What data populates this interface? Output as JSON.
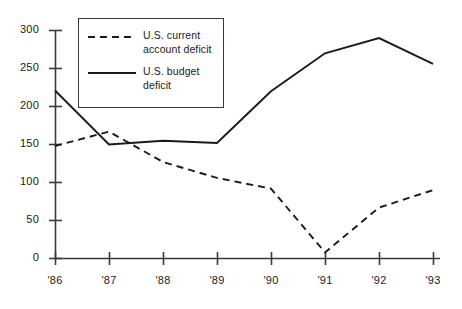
{
  "chart_data": {
    "type": "line",
    "title": "",
    "subtitle": "",
    "xlabel": "",
    "ylabel": "",
    "x": [
      "'86",
      "'87",
      "'88",
      "'89",
      "'90",
      "'91",
      "'92",
      "'93"
    ],
    "categories": [
      "'86",
      "'87",
      "'88",
      "'89",
      "'90",
      "'91",
      "'92",
      "'93"
    ],
    "series": [
      {
        "name": "U.S. current account deficit",
        "style": "dashed",
        "color": "#1a1a1a",
        "values": [
          148,
          167,
          127,
          106,
          92,
          8,
          67,
          90
        ]
      },
      {
        "name": "U.S. budget deficit",
        "style": "solid",
        "color": "#1a1a1a",
        "values": [
          221,
          150,
          155,
          152,
          220,
          270,
          290,
          256
        ]
      }
    ],
    "ylim": [
      0,
      300
    ],
    "yticks": [
      0,
      50,
      100,
      150,
      200,
      250,
      300
    ],
    "ytick_labels": [
      "0",
      "50",
      "100",
      "150",
      "200",
      "250",
      "300"
    ],
    "xtick_labels": [
      "'86",
      "'87",
      "'88",
      "'89",
      "'90",
      "'91",
      "'92",
      "'93"
    ],
    "grid": false,
    "legend_position": "top-left-inset"
  },
  "legend": {
    "entries": [
      {
        "label": "U.S. current\naccount deficit",
        "style": "dashed"
      },
      {
        "label": "U.S. budget\ndeficit",
        "style": "solid"
      }
    ]
  },
  "axes": {
    "y_labels": [
      "300",
      "250",
      "200",
      "150",
      "100",
      "50",
      "0"
    ],
    "x_labels": [
      "'86",
      "'87",
      "'88",
      "'89",
      "'90",
      "'91",
      "'92",
      "'93"
    ]
  },
  "colors": {
    "line": "#1a1a1a",
    "axis": "#3a3a3a",
    "background": "#ffffff",
    "text": "#1a1a1a"
  }
}
